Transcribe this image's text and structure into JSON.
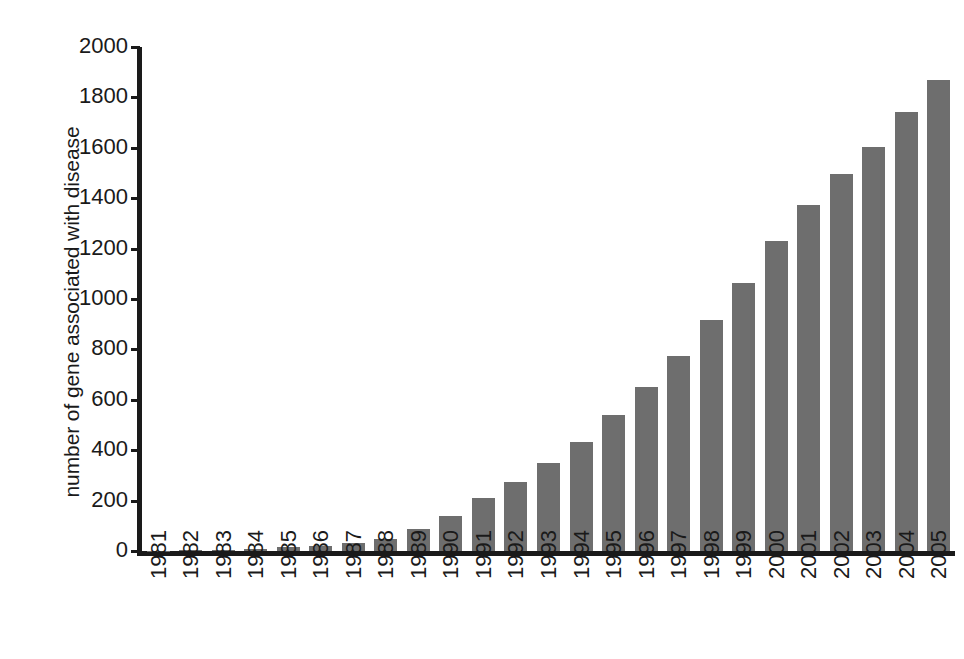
{
  "chart_data": {
    "type": "bar",
    "title": "",
    "subtitle": "",
    "xlabel": "",
    "ylabel": "number of gene associated with disease",
    "categories": [
      "1981",
      "1982",
      "1983",
      "1984",
      "1985",
      "1986",
      "1987",
      "1988",
      "1989",
      "1990",
      "1991",
      "1992",
      "1993",
      "1994",
      "1995",
      "1996",
      "1997",
      "1998",
      "1999",
      "2000",
      "2001",
      "2002",
      "2003",
      "2004",
      "2005"
    ],
    "values": [
      2,
      4,
      6,
      8,
      14,
      20,
      32,
      48,
      88,
      140,
      210,
      272,
      348,
      432,
      538,
      652,
      772,
      918,
      1064,
      1230,
      1372,
      1496,
      1604,
      1744,
      1870
    ],
    "ylim": [
      0,
      2000
    ],
    "y_ticks": [
      0,
      200,
      400,
      600,
      800,
      1000,
      1200,
      1400,
      1600,
      1800,
      2000
    ],
    "y_tick_labels": [
      "0",
      "200",
      "400",
      "600",
      "800",
      "1000",
      "1200",
      "1400",
      "1600",
      "1800",
      "2000"
    ],
    "grid": false,
    "legend": false,
    "legend_position": "none",
    "bar_color": "#6e6e6e",
    "axis_color": "#1a1a1a",
    "background_color": "#ffffff",
    "series": [
      {
        "name": "number of gene associated with disease",
        "values": [
          2,
          4,
          6,
          8,
          14,
          20,
          32,
          48,
          88,
          140,
          210,
          272,
          348,
          432,
          538,
          652,
          772,
          918,
          1064,
          1230,
          1372,
          1496,
          1604,
          1744,
          1870
        ]
      }
    ]
  }
}
